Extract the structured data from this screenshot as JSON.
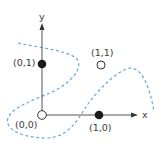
{
  "diagram": {
    "axes": {
      "x_label": "x",
      "y_label": "y"
    },
    "points": [
      {
        "label": "(0,0)",
        "fill": "hollow"
      },
      {
        "label": "(0,1)",
        "fill": "filled"
      },
      {
        "label": "(1,0)",
        "fill": "filled"
      },
      {
        "label": "(1,1)",
        "fill": "hollow"
      }
    ],
    "boundary": {
      "style": "dashed",
      "color": "#6aa8d8"
    },
    "colors": {
      "axis": "#555555",
      "filled_point": "#1a1a1a",
      "hollow_point_stroke": "#333333",
      "boundary": "#6aa8d8"
    }
  }
}
